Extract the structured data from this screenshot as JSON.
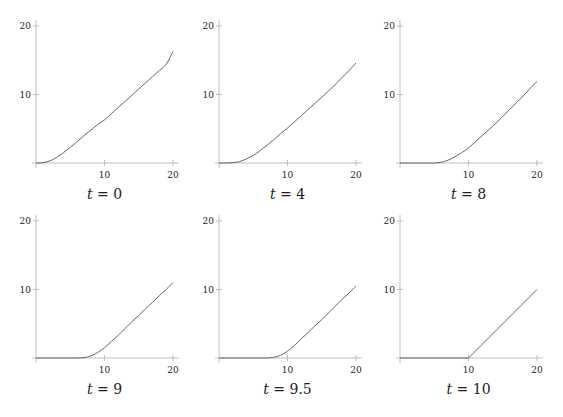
{
  "figure": {
    "layout": {
      "rows": 2,
      "cols": 3
    },
    "axis_color": "#b0b0b0",
    "curve_color": "#555555"
  },
  "chart_data": [
    {
      "type": "line",
      "title": "t = 0",
      "caption_var": "t",
      "caption_value": "0",
      "xlabel": "",
      "ylabel": "",
      "xlim": [
        0,
        20
      ],
      "ylim": [
        0,
        20
      ],
      "xticks": [
        10,
        20
      ],
      "yticks": [
        10,
        20
      ],
      "grid": false,
      "x": [
        0,
        1,
        2,
        3,
        4,
        5,
        6,
        7,
        8,
        9,
        10,
        11,
        12,
        13,
        14,
        15,
        16,
        17,
        18,
        19,
        20
      ],
      "y": [
        0,
        0.05,
        0.3,
        0.8,
        1.5,
        2.3,
        3.1,
        4.0,
        4.8,
        5.6,
        6.3,
        7.2,
        8.1,
        9.0,
        9.9,
        10.8,
        11.7,
        12.6,
        13.5,
        14.4,
        16.3
      ]
    },
    {
      "type": "line",
      "title": "t = 4",
      "caption_var": "t",
      "caption_value": "4",
      "xlabel": "",
      "ylabel": "",
      "xlim": [
        0,
        20
      ],
      "ylim": [
        0,
        20
      ],
      "xticks": [
        10,
        20
      ],
      "yticks": [
        10,
        20
      ],
      "grid": false,
      "x": [
        0,
        1,
        2,
        3,
        4,
        5,
        6,
        7,
        8,
        9,
        10,
        11,
        12,
        13,
        14,
        15,
        16,
        17,
        18,
        19,
        20
      ],
      "y": [
        0,
        0,
        0.05,
        0.2,
        0.6,
        1.1,
        1.8,
        2.6,
        3.4,
        4.3,
        5.1,
        6.0,
        6.9,
        7.8,
        8.7,
        9.6,
        10.5,
        11.5,
        12.5,
        13.5,
        14.6
      ]
    },
    {
      "type": "line",
      "title": "t = 8",
      "caption_var": "t",
      "caption_value": "8",
      "xlabel": "",
      "ylabel": "",
      "xlim": [
        0,
        20
      ],
      "ylim": [
        0,
        20
      ],
      "xticks": [
        10,
        20
      ],
      "yticks": [
        10,
        20
      ],
      "grid": false,
      "x": [
        0,
        1,
        2,
        3,
        4,
        5,
        6,
        7,
        8,
        9,
        10,
        11,
        12,
        13,
        14,
        15,
        16,
        17,
        18,
        19,
        20
      ],
      "y": [
        0,
        0,
        0,
        0,
        0,
        0,
        0.1,
        0.4,
        0.9,
        1.5,
        2.2,
        3.1,
        4.0,
        4.9,
        5.8,
        6.8,
        7.8,
        8.8,
        9.8,
        10.9,
        11.9
      ]
    },
    {
      "type": "line",
      "title": "t = 9",
      "caption_var": "t",
      "caption_value": "9",
      "xlabel": "",
      "ylabel": "",
      "xlim": [
        0,
        20
      ],
      "ylim": [
        0,
        20
      ],
      "xticks": [
        10,
        20
      ],
      "yticks": [
        10,
        20
      ],
      "grid": false,
      "x": [
        0,
        1,
        2,
        3,
        4,
        5,
        6,
        7,
        8,
        9,
        10,
        11,
        12,
        13,
        14,
        15,
        16,
        17,
        18,
        19,
        20
      ],
      "y": [
        0,
        0,
        0,
        0,
        0,
        0,
        0,
        0.05,
        0.3,
        0.8,
        1.5,
        2.4,
        3.3,
        4.3,
        5.3,
        6.2,
        7.2,
        8.1,
        9.1,
        10.0,
        11.0
      ]
    },
    {
      "type": "line",
      "title": "t = 9.5",
      "caption_var": "t",
      "caption_value": "9.5",
      "xlabel": "",
      "ylabel": "",
      "xlim": [
        0,
        20
      ],
      "ylim": [
        0,
        20
      ],
      "xticks": [
        10,
        20
      ],
      "yticks": [
        10,
        20
      ],
      "grid": false,
      "x": [
        0,
        1,
        2,
        3,
        4,
        5,
        6,
        7,
        8,
        9,
        10,
        11,
        12,
        13,
        14,
        15,
        16,
        17,
        18,
        19,
        20
      ],
      "y": [
        0,
        0,
        0,
        0,
        0,
        0,
        0,
        0,
        0.1,
        0.4,
        1.0,
        1.8,
        2.8,
        3.7,
        4.7,
        5.6,
        6.6,
        7.6,
        8.6,
        9.5,
        10.5
      ]
    },
    {
      "type": "line",
      "title": "t = 10",
      "caption_var": "t",
      "caption_value": "10",
      "xlabel": "",
      "ylabel": "",
      "xlim": [
        0,
        20
      ],
      "ylim": [
        0,
        20
      ],
      "xticks": [
        10,
        20
      ],
      "yticks": [
        10,
        20
      ],
      "grid": false,
      "x": [
        0,
        10,
        20
      ],
      "y": [
        0,
        0,
        10
      ]
    }
  ]
}
